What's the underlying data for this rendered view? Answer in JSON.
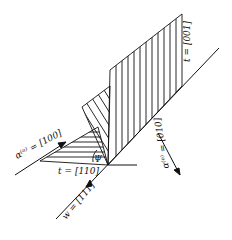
{
  "diagram": {
    "labels": {
      "t_001": "t = [001]",
      "alpha_a": "α⁽ᵃ⁾ = [100]",
      "psi": "Ψ",
      "t_110": "t = [110]",
      "alpha_e": "α⁽ᵉ⁾ = [010]",
      "w_111": "w = [111]"
    },
    "colors": {
      "stroke": "#111111",
      "background": "#ffffff"
    }
  }
}
